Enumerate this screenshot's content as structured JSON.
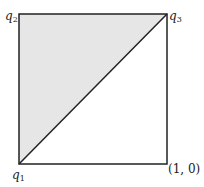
{
  "diagram": {
    "type": "unit-square-triangle",
    "colors": {
      "stroke": "#222222",
      "fill": "#e6e6e6",
      "background": "#ffffff"
    },
    "vertices": {
      "q1": {
        "name": "q",
        "sub": "1"
      },
      "q2": {
        "name": "q",
        "sub": "2"
      },
      "q3": {
        "name": "q",
        "sub": "3"
      },
      "corner": {
        "label": "(1, 0)"
      }
    },
    "shaded_region": "triangle q1-q2-q3"
  }
}
